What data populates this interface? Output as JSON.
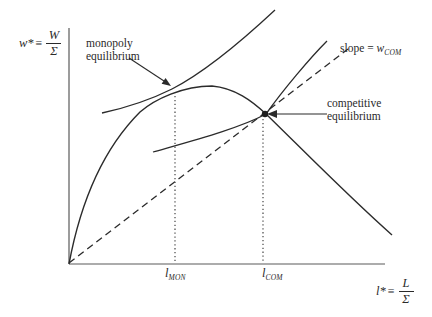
{
  "figure": {
    "bg": "#ffffff",
    "curve_color": "#2b2b2b",
    "axis_color": "#5a5a5a",
    "text_color": "#2a2a2a"
  },
  "labels": {
    "y_axis": {
      "var": "w*",
      "equiv": "≡",
      "num": "W",
      "den": "Σ"
    },
    "x_axis": {
      "var": "l*",
      "equiv": "≡",
      "num": "L",
      "den": "Σ"
    },
    "monopoly": {
      "line1": "monopoly",
      "line2": "equilibrium"
    },
    "competitive": {
      "line1": "competitive",
      "line2": "equilibrium"
    },
    "slope": {
      "prefix": "slope = ",
      "var": "w",
      "sub": "COM"
    },
    "ticks": {
      "mon": {
        "base": "l",
        "sub": "MON"
      },
      "com": {
        "base": "l",
        "sub": "COM"
      }
    }
  }
}
